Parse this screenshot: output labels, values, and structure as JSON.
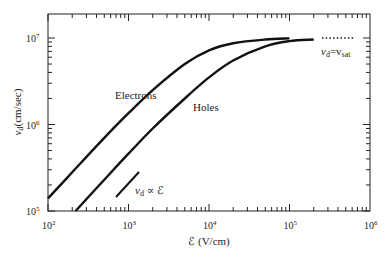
{
  "chart_data": {
    "type": "line",
    "title": "",
    "xlabel": "ℰ (V/cm)",
    "ylabel": "v_d(cm/sec)",
    "xscale": "log",
    "yscale": "log",
    "xlim": [
      100,
      1000000
    ],
    "ylim": [
      100000,
      20000000
    ],
    "x_tick_labels": [
      "10²",
      "10³",
      "10⁴",
      "10⁵",
      "10⁶"
    ],
    "y_tick_labels": [
      "10⁵",
      "10⁶",
      "10⁷"
    ],
    "grid": false,
    "series": [
      {
        "name": "Electrons",
        "x": [
          100,
          200,
          500,
          1000,
          2000,
          5000,
          10000,
          20000,
          50000,
          100000
        ],
        "y": [
          140000,
          280000,
          700000,
          1350000,
          2500000,
          5000000,
          7200000,
          8700000,
          9600000,
          9900000
        ]
      },
      {
        "name": "Holes",
        "x": [
          220,
          500,
          1000,
          2000,
          5000,
          10000,
          20000,
          50000,
          100000,
          200000
        ],
        "y": [
          100000,
          230000,
          460000,
          900000,
          2000000,
          3500000,
          5500000,
          8000000,
          9200000,
          9600000
        ]
      },
      {
        "name": "v_d ∝ ℰ (reference slope)",
        "x": [
          750,
          1450
        ],
        "y": [
          160000,
          310000
        ]
      },
      {
        "name": "v_d = v_sat (dotted)",
        "x": [
          300000,
          700000
        ],
        "y": [
          9800000,
          9800000
        ]
      }
    ],
    "annotations": [
      "Electrons",
      "Holes",
      "v_d ∝ ℰ",
      "v_d=v_sat"
    ]
  },
  "labels": {
    "electrons": "Electrons",
    "holes": "Holes",
    "prop": "v",
    "prop_sub": "d",
    "prop_rest": " ∝ ℰ",
    "sat_v": "v",
    "sat_sub": "d",
    "sat_eq": "=v",
    "sat_sub2": "sat",
    "xlabel": "ℰ (V/cm)",
    "ylabel_v": "v",
    "ylabel_sub": "d",
    "ylabel_rest": "(cm/sec)",
    "x_ticks": [
      "10",
      "10",
      "10",
      "10",
      "10"
    ],
    "x_exps": [
      "2",
      "3",
      "4",
      "5",
      "6"
    ],
    "y_ticks": [
      "10",
      "10",
      "10"
    ],
    "y_exps": [
      "5",
      "6",
      "7"
    ]
  }
}
